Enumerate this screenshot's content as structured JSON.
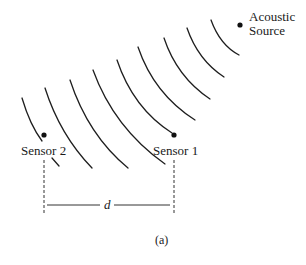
{
  "figure": {
    "caption": "(a)",
    "source": {
      "label_line1": "Acoustic",
      "label_line2": "Source"
    },
    "sensors": [
      {
        "label": "Sensor 1"
      },
      {
        "label": "Sensor 2"
      }
    ],
    "distance_label": "d",
    "wavefront_count": 9,
    "colors": {
      "ink": "#1e1e1e",
      "background": "#ffffff"
    }
  }
}
